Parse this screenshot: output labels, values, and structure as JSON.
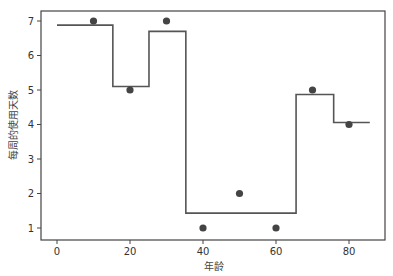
{
  "chart_data": {
    "type": "line",
    "title": "",
    "xlabel": "年龄",
    "ylabel": "每周的使用天数",
    "xlim": [
      -4,
      90
    ],
    "ylim": [
      0.7,
      7.35
    ],
    "xticks": [
      0,
      20,
      40,
      60,
      80
    ],
    "yticks": [
      1,
      2,
      3,
      4,
      5,
      6,
      7
    ],
    "grid": false,
    "legend": null,
    "series": [
      {
        "name": "data points",
        "kind": "scatter",
        "color": "#444444",
        "x": [
          10,
          20,
          30,
          40,
          50,
          60,
          70,
          80
        ],
        "y": [
          7,
          5,
          7,
          1,
          2,
          1,
          5,
          4
        ]
      },
      {
        "name": "step prediction",
        "kind": "step",
        "color": "#555555",
        "segments": [
          {
            "x_start": 0,
            "x_end": 15.3,
            "y": 6.88
          },
          {
            "x_start": 15.3,
            "x_end": 25.2,
            "y": 5.1
          },
          {
            "x_start": 25.2,
            "x_end": 35.3,
            "y": 6.7
          },
          {
            "x_start": 35.3,
            "x_end": 65.5,
            "y": 1.43
          },
          {
            "x_start": 65.5,
            "x_end": 75.8,
            "y": 4.87
          },
          {
            "x_start": 75.8,
            "x_end": 85.7,
            "y": 4.06
          }
        ]
      }
    ]
  }
}
